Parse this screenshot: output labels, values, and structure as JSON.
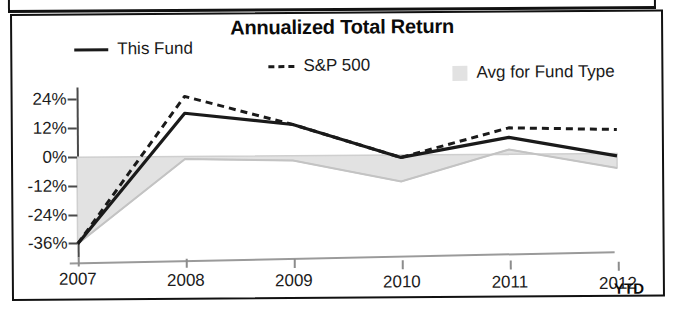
{
  "chart_data": {
    "type": "line",
    "title": "Annualized Total Return",
    "xlabel": "",
    "ylabel": "",
    "x": [
      "2007",
      "2008",
      "2009",
      "2010",
      "2011",
      "2012"
    ],
    "x_suffix_label": "YTD",
    "ytick_labels": [
      "24%",
      "12%",
      "0%",
      "-12%",
      "-24%",
      "-36%"
    ],
    "ytick_values": [
      24,
      12,
      0,
      -12,
      -24,
      -36
    ],
    "ylim": [
      -40,
      29
    ],
    "grid": false,
    "legend_position": "top",
    "series": [
      {
        "name": "This Fund",
        "style": "solid",
        "color": "#1a1a1a",
        "values": [
          -36,
          18,
          13,
          -1,
          7,
          -1
        ]
      },
      {
        "name": "S&P 500",
        "style": "dashed",
        "color": "#1a1a1a",
        "values": [
          -36,
          25,
          13,
          -1,
          11,
          10
        ]
      },
      {
        "name": "Avg for Fund Type",
        "style": "area",
        "color": "#e2e2e2",
        "values": [
          -36,
          -1,
          -2,
          -11,
          2,
          -6
        ]
      }
    ],
    "baseline": 0
  },
  "chart": {
    "title": "Annualized Total Return",
    "ytd_label": "YTD",
    "legend": [
      {
        "label": "This Fund",
        "swatch": "solid-line-swatch"
      },
      {
        "label": "S&P 500",
        "swatch": "dashed-line-swatch"
      },
      {
        "label": "Avg for Fund Type",
        "swatch": "gray-box-swatch"
      }
    ]
  },
  "colors": {
    "line": "#1a1a1a",
    "area_fill": "#e2e2e2",
    "axis": "#4a4a4a",
    "frame": "#111111"
  }
}
